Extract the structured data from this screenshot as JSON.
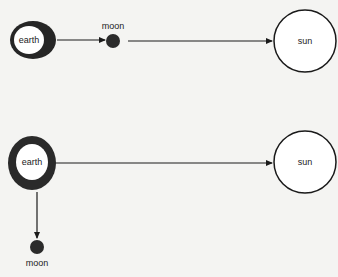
{
  "colors": {
    "background": "#f4f4f2",
    "stroke": "#1a1a1a",
    "earth_ring": "#2a2a2a",
    "moon_fill": "#2b2b2b"
  },
  "diagrams": [
    {
      "id": "top",
      "earth": {
        "label": "earth"
      },
      "moon": {
        "label": "moon",
        "position": "between earth and sun"
      },
      "sun": {
        "label": "sun"
      },
      "arrows": [
        {
          "from": "earth",
          "to": "moon"
        },
        {
          "from": "moon",
          "to": "sun"
        }
      ]
    },
    {
      "id": "bottom",
      "earth": {
        "label": "earth"
      },
      "moon": {
        "label": "moon",
        "position": "below earth"
      },
      "sun": {
        "label": "sun"
      },
      "arrows": [
        {
          "from": "earth",
          "to": "sun"
        },
        {
          "from": "earth",
          "to": "moon"
        }
      ]
    }
  ]
}
